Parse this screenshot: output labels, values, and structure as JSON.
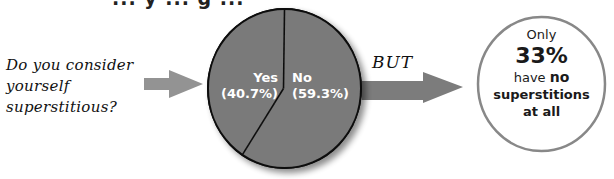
{
  "title_fragment": "... y ... g ...",
  "question": {
    "line1": "Do you consider",
    "line2": "yourself",
    "line3": "superstitious?"
  },
  "connector_text": "BUT",
  "colors": {
    "pie_fill": "#7a7a7a",
    "pie_stroke": "#111111",
    "arrow_left": "#939393",
    "arrow_right": "#7c7c7c",
    "circle_stroke": "#888888",
    "label_text": "#ffffff"
  },
  "chart_data": {
    "type": "pie",
    "title": "",
    "slices": [
      {
        "label": "Yes",
        "value": 40.7,
        "display": "(40.7%)"
      },
      {
        "label": "No",
        "value": 59.3,
        "display": "(59.3%)"
      }
    ],
    "start": "12 o'clock",
    "direction": "Yes counter-clockwise, No clockwise"
  },
  "callout": {
    "line1": "Only",
    "value": "33%",
    "line3_prefix": "have ",
    "line3_bold": "no",
    "line4": "superstitions",
    "line5": "at all"
  }
}
